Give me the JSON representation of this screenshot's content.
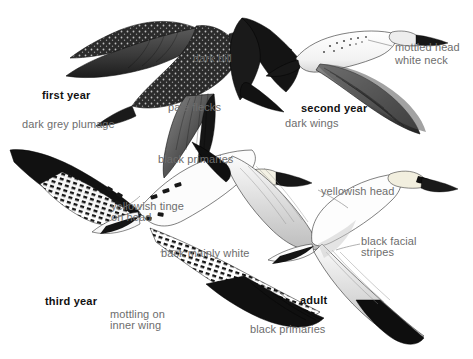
{
  "plate": {
    "subject": "Northern Gannet age plumages in flight",
    "background_color": "#ffffff",
    "label_color": "#6d6d6d",
    "age_label_color": "#111111"
  },
  "labels": [
    {
      "id": "dark-bill",
      "text": "dark bill",
      "x": 193,
      "y": 53,
      "bold": false
    },
    {
      "id": "first-year",
      "text": "first year",
      "x": 42,
      "y": 90,
      "bold": true
    },
    {
      "id": "pale-flecks",
      "text": "pale flecks",
      "x": 168,
      "y": 102,
      "bold": false
    },
    {
      "id": "dark-grey-plumage",
      "text": "dark grey plumage",
      "x": 22,
      "y": 119,
      "bold": false
    },
    {
      "id": "black-primaries-top",
      "text": "black primaries",
      "x": 158,
      "y": 154,
      "bold": false
    },
    {
      "id": "mottled-head",
      "text": "mottled head",
      "x": 395,
      "y": 42,
      "bold": false
    },
    {
      "id": "white-neck",
      "text": "white neck",
      "x": 395,
      "y": 55,
      "bold": false
    },
    {
      "id": "second-year",
      "text": "second year",
      "x": 301,
      "y": 103,
      "bold": true
    },
    {
      "id": "dark-wings",
      "text": "dark wings",
      "x": 285,
      "y": 118,
      "bold": false
    },
    {
      "id": "yellowish-tinge",
      "text": "yellowish tinge",
      "x": 111,
      "y": 201,
      "bold": false
    },
    {
      "id": "on-head",
      "text": "on head",
      "x": 111,
      "y": 212,
      "bold": false
    },
    {
      "id": "back-mainly-white",
      "text": "back mainly white",
      "x": 161,
      "y": 248,
      "bold": false
    },
    {
      "id": "third-year",
      "text": "third year",
      "x": 45,
      "y": 296,
      "bold": true
    },
    {
      "id": "mottling-on",
      "text": "mottling on",
      "x": 110,
      "y": 309,
      "bold": false
    },
    {
      "id": "inner-wing",
      "text": "inner wing",
      "x": 110,
      "y": 320,
      "bold": false
    },
    {
      "id": "yellowish-head",
      "text": "yellowish head",
      "x": 321,
      "y": 186,
      "bold": false
    },
    {
      "id": "black-facial",
      "text": "black facial",
      "x": 361,
      "y": 236,
      "bold": false
    },
    {
      "id": "stripes",
      "text": "stripes",
      "x": 361,
      "y": 247,
      "bold": false
    },
    {
      "id": "adult",
      "text": "adult",
      "x": 300,
      "y": 295,
      "bold": true
    },
    {
      "id": "black-primaries-bot",
      "text": "black primaries",
      "x": 250,
      "y": 324,
      "bold": false
    }
  ],
  "birds": [
    {
      "id": "first-year-gannet",
      "age": "first year",
      "plumage": "dark grey, pale flecking"
    },
    {
      "id": "second-year-gannet",
      "age": "second year",
      "plumage": "mottled head, white neck, dark wings"
    },
    {
      "id": "third-year-gannet",
      "age": "third year",
      "plumage": "back mainly white, mottling on inner wing"
    },
    {
      "id": "adult-gannet",
      "age": "adult",
      "plumage": "white with black primaries, yellowish head"
    }
  ]
}
